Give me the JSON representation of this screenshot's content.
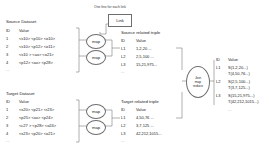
{
  "caption": {
    "link_note": "One line for each link"
  },
  "nodes": {
    "link_box": "Link",
    "map_label": "map",
    "join_line1": "Join",
    "join_line2": "map",
    "join_line3": "reduce"
  },
  "source_dataset": {
    "title": "Source Dataset",
    "headers": [
      "ID",
      "Value"
    ],
    "rows": [
      {
        "id": "1",
        "value": "<s10> <p10> <o10>"
      },
      {
        "id": "2",
        "value": "<s10> <p12> <o11>"
      },
      {
        "id": "3",
        "value": "<s10 > <ax> <o21>"
      },
      {
        "id": "4",
        "value": "<p12> <ax> <p28>"
      }
    ],
    "ellipsis": "..."
  },
  "target_dataset": {
    "title": "Target Dataset",
    "headers": [
      "ID",
      "Value"
    ],
    "rows": [
      {
        "id": "1",
        "value": "<s20> <p21> <r23>"
      },
      {
        "id": "2",
        "value": "<p25> <ax> <p24>"
      },
      {
        "id": "3",
        "value": "<c27 > <p28> <o24>"
      },
      {
        "id": "4",
        "value": "<s23> <p20> <o21>"
      }
    ],
    "ellipsis": "..."
  },
  "source_related": {
    "title": "Source related triple",
    "headers": [
      "ID",
      "Value"
    ],
    "rows": [
      {
        "id": "L1",
        "value": "1,2,20 ..."
      },
      {
        "id": "L2",
        "value": "2,5,100 ..."
      },
      {
        "id": "L3",
        "value": "15,21,975..."
      }
    ],
    "ellipsis": "..."
  },
  "target_related": {
    "title": "Target related triple",
    "headers": [
      "ID",
      "Value"
    ],
    "rows": [
      {
        "id": "L1",
        "value": "4,50,76 ..."
      },
      {
        "id": "L2",
        "value": "3,7,125 ..."
      },
      {
        "id": "L3",
        "value": "42,212,1015..."
      }
    ],
    "ellipsis": "..."
  },
  "joined_result": {
    "headers": [
      "ID",
      "Value"
    ],
    "rows": [
      {
        "id": "L1",
        "value_s": "S(1,2,20...)",
        "value_t": "T(4,50,76...)"
      },
      {
        "id": "L2",
        "value_s": "S(2,5,100...)",
        "value_t": "T(3,7,125...)"
      },
      {
        "id": "L3",
        "value_s": "S(15,21,975...)",
        "value_t": "T(42,212,1015...)"
      }
    ],
    "ellipsis": "..."
  },
  "colors": {
    "stroke": "#6e6e6e",
    "text": "#232323",
    "background": "#ffffff"
  }
}
